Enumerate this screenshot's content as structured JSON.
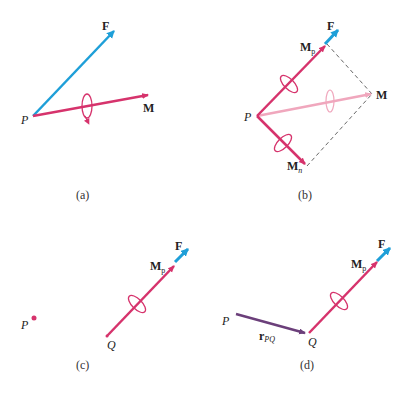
{
  "colors": {
    "moment": "#d6336c",
    "moment_faded": "#f0a7bd",
    "force": "#1e9fd8",
    "position": "#6b3f7a",
    "dashed": "#555555"
  },
  "panels": {
    "a": {
      "caption": "(a)",
      "labels": {
        "force": "F",
        "moment": "M",
        "point": "P"
      }
    },
    "b": {
      "caption": "(b)",
      "labels": {
        "force": "F",
        "moment": "M",
        "point": "P",
        "mp_base": "M",
        "mp_sub": "p",
        "mn_base": "M",
        "mn_sub": "n"
      }
    },
    "c": {
      "caption": "(c)",
      "labels": {
        "force": "F",
        "point_p": "P",
        "point_q": "Q",
        "mp_base": "M",
        "mp_sub": "p"
      }
    },
    "d": {
      "caption": "(d)",
      "labels": {
        "force": "F",
        "point_p": "P",
        "point_q": "Q",
        "mp_base": "M",
        "mp_sub": "p",
        "r_base": "r",
        "r_sub": "PQ"
      }
    }
  }
}
